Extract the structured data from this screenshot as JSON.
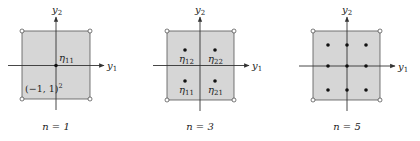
{
  "figure": {
    "axis_labels": {
      "horizontal": "y",
      "horizontal_sub": "1",
      "vertical": "y",
      "vertical_sub": "2"
    },
    "colors": {
      "fill": "#d6d6d6",
      "stroke": "#333333",
      "point": "#111111",
      "background": "#ffffff"
    },
    "panels": [
      {
        "caption": "n = 1",
        "domain_label": "(−1, 1)",
        "domain_exp": "2",
        "points": [
          {
            "label": "η",
            "sub": "11"
          }
        ]
      },
      {
        "caption": "n = 3",
        "points": [
          {
            "label": "η",
            "sub": "12"
          },
          {
            "label": "η",
            "sub": "22"
          },
          {
            "label": "η",
            "sub": "11"
          },
          {
            "label": "η",
            "sub": "21"
          }
        ]
      },
      {
        "caption": "n = 5",
        "points_grid": "3x3"
      }
    ]
  }
}
